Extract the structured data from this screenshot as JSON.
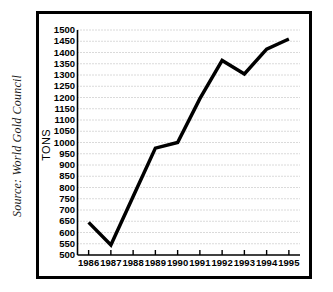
{
  "source_note": "Source: World Gold Council",
  "axis": {
    "y_title": "TONS"
  },
  "chart_data": {
    "type": "line",
    "title": "",
    "subtitle": "",
    "xlabel": "",
    "ylabel": "TONS",
    "categories": [
      "1986",
      "1987",
      "1988",
      "1989",
      "1990",
      "1991",
      "1992",
      "1993",
      "1994",
      "1995"
    ],
    "x": [
      1986,
      1987,
      1988,
      1989,
      1990,
      1991,
      1992,
      1993,
      1994,
      1995
    ],
    "values": [
      645,
      545,
      760,
      975,
      1000,
      1195,
      1365,
      1305,
      1415,
      1460
    ],
    "series": [
      {
        "name": "Gold demand",
        "values": [
          645,
          545,
          760,
          975,
          1000,
          1195,
          1365,
          1305,
          1415,
          1460
        ]
      }
    ],
    "ylim": [
      500,
      1500
    ],
    "ytick_step": 50,
    "ytick_labels": [
      "1500",
      "1450",
      "1400",
      "1350",
      "1300",
      "1250",
      "1200",
      "1150",
      "1100",
      "1050",
      "1000",
      "950",
      "900",
      "850",
      "800",
      "750",
      "700",
      "650",
      "600",
      "550",
      "500"
    ],
    "ytick_values": [
      1500,
      1450,
      1400,
      1350,
      1300,
      1250,
      1200,
      1150,
      1100,
      1050,
      1000,
      950,
      900,
      850,
      800,
      750,
      700,
      650,
      600,
      550,
      500
    ],
    "xtick_labels": [
      "1986",
      "1987",
      "1988",
      "1989",
      "1990",
      "1991",
      "1992",
      "1993",
      "1994",
      "1995"
    ],
    "grid": true,
    "grid_axis": "y",
    "grid_style": "dotted",
    "legend": false,
    "legend_position": "none",
    "line_color": "#000000",
    "line_width": 3.5,
    "grid_color": "#b4b4b4",
    "axis_color": "#000000",
    "background_color": "#ffffff",
    "frame_color": "#000000"
  }
}
